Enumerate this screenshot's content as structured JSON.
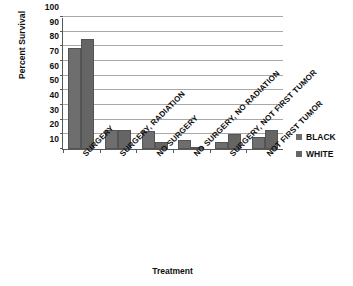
{
  "chart_data": {
    "type": "bar",
    "title": "",
    "xlabel": "Treatment",
    "ylabel": "Percent Survival",
    "ylim": [
      10,
      100
    ],
    "ytick_labels": [
      "100",
      "90",
      "80",
      "70",
      "60",
      "50",
      "40",
      "30",
      "20",
      "10"
    ],
    "ytick_values": [
      100,
      90,
      80,
      70,
      60,
      50,
      40,
      30,
      20,
      10
    ],
    "grid": true,
    "legend_position": "right",
    "categories": [
      "SURGERY",
      "SURGERY, RADIATION",
      "NO SURGERY",
      "NO SURGERY, NO RADIATION",
      "SURGERY, NOT FIRST TUMOR",
      "NOT FIRST TUMOR"
    ],
    "series": [
      {
        "name": "BLACK",
        "color": "#6e6e6e",
        "values": [
          79,
          23,
          22,
          16,
          15,
          18
        ]
      },
      {
        "name": "WHITE",
        "color": "#656565",
        "values": [
          85,
          23,
          14.5,
          11,
          20,
          23
        ]
      }
    ]
  },
  "legend": {
    "items": [
      {
        "label": "BLACK",
        "color": "#6e6e6e"
      },
      {
        "label": "WHITE",
        "color": "#656565"
      }
    ]
  }
}
